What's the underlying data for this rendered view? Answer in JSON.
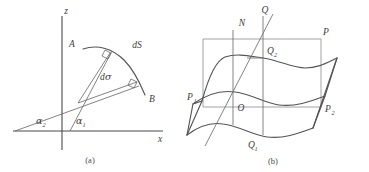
{
  "figure": {
    "panels": [
      {
        "id": "a",
        "caption": "(a)",
        "axes": {
          "vertical_label": "z",
          "horizontal_label": "x"
        },
        "labels": {
          "point_a": "A",
          "point_b": "B",
          "arc_element": "dS",
          "angle_element": "d",
          "angle_element_greek": "σ",
          "angle_lower_base": "α",
          "angle_lower_sub": "2",
          "angle_upper_base": "α",
          "angle_upper_sub": "1"
        }
      },
      {
        "id": "b",
        "caption": "(b)",
        "labels": {
          "normal": "N",
          "apex": "Q",
          "plane_corner": "P",
          "upper_point_base": "Q",
          "upper_point_sub": "2",
          "left_point_base": "P",
          "left_point_sub": "1",
          "origin": "O",
          "right_point_base": "P",
          "right_point_sub": "2",
          "lower_point_base": "Q",
          "lower_point_sub": "1"
        }
      }
    ],
    "colors": {
      "ink": "#3d3d3d",
      "axis": "#4a4a4a",
      "curve": "#555555",
      "thin": "#6d6d6d",
      "frame": "#8c8c8c",
      "background": "#ffffff"
    }
  }
}
